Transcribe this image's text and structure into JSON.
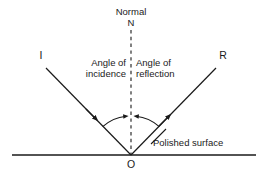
{
  "diagram": {
    "background_color": "#ffffff",
    "line_color": "#1a1a1a",
    "labels": {
      "normal": "Normal",
      "normal_symbol": "N",
      "angle_of_incidence": "Angle of\nincidence",
      "angle_of_incidence_line1": "Angle of",
      "angle_of_incidence_line2": "incidence",
      "angle_of_reflection": "Angle of\nreflection",
      "angle_of_reflection_line1": "Angle of",
      "angle_of_reflection_line2": "reflection",
      "incident_ray": "I",
      "reflected_ray": "R",
      "polished_surface": "Polished surface",
      "origin": "O"
    },
    "geometry": {
      "vertex": {
        "x": 131,
        "y": 155
      },
      "surface_line": {
        "x1": 12,
        "y1": 155,
        "x2": 256,
        "y2": 155
      },
      "normal_line": {
        "x1": 131,
        "y1": 30,
        "x2": 131,
        "y2": 155,
        "style": "dashed"
      },
      "incident_ray": {
        "x1": 46,
        "y1": 68,
        "x2": 131,
        "y2": 155,
        "arrow_at": {
          "x": 95,
          "y": 118
        },
        "direction": "toward-vertex"
      },
      "reflected_ray": {
        "x1": 131,
        "y1": 155,
        "x2": 216,
        "y2": 68,
        "arrow_at": {
          "x": 168,
          "y": 117
        },
        "direction": "away-from-vertex"
      },
      "angle_arc_incidence": {
        "radius": 40,
        "from_deg": 225,
        "to_deg": 270
      },
      "angle_arc_reflection": {
        "radius": 40,
        "from_deg": 270,
        "to_deg": 315
      },
      "leader_polished_surface": {
        "x1": 152,
        "y1": 143,
        "x2": 164,
        "y2": 130
      }
    }
  }
}
